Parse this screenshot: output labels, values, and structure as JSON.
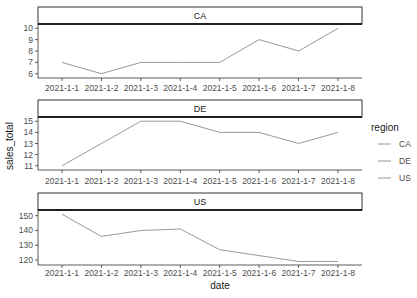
{
  "chart_data": {
    "type": "line",
    "title": "",
    "xlabel": "date",
    "ylabel": "sales_total",
    "facet_by": "region",
    "categories": [
      "2021-1-1",
      "2021-1-2",
      "2021-1-3",
      "2021-1-4",
      "2021-1-5",
      "2021-1-6",
      "2021-1-7",
      "2021-1-8"
    ],
    "panels": [
      {
        "label": "CA",
        "yticks": [
          6,
          7,
          8,
          9,
          10
        ],
        "ylim": [
          5.8,
          10.2
        ],
        "series": [
          {
            "name": "CA",
            "values": [
              7,
              6,
              7,
              7,
              7,
              9,
              8,
              10
            ]
          }
        ]
      },
      {
        "label": "DE",
        "yticks": [
          11,
          12,
          13,
          14,
          15
        ],
        "ylim": [
          10.8,
          15.2
        ],
        "series": [
          {
            "name": "DE",
            "values": [
              11,
              13,
              15,
              15,
              14,
              14,
              13,
              14
            ]
          }
        ]
      },
      {
        "label": "US",
        "yticks": [
          120,
          130,
          140,
          150
        ],
        "ylim": [
          118,
          152.5
        ],
        "series": [
          {
            "name": "US",
            "values": [
              151,
              136,
              140,
              141,
              127,
              123,
              119,
              119
            ]
          }
        ]
      }
    ],
    "legend": {
      "title": "region",
      "position": "right",
      "entries": [
        "CA",
        "DE",
        "US"
      ]
    },
    "grid": false,
    "line_color": "#8c8c8c"
  }
}
